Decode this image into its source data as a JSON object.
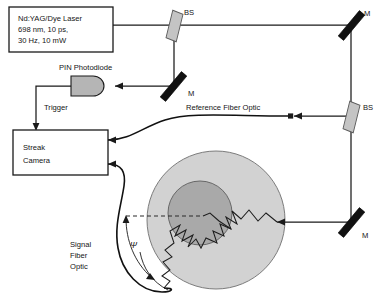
{
  "diagram": {
    "laser_box": {
      "name": "laser-source",
      "lines": [
        "Nd:YAG/Dye Laser",
        "698 nm, 10 ps,",
        "30 Hz, 10 mW"
      ]
    },
    "detector_box": {
      "name": "streak-camera",
      "lines": [
        "Streak",
        "Camera"
      ]
    },
    "components": {
      "photodiode_label": "PIN Photodiode",
      "trigger_label": "Trigger",
      "reference_fiber_label": "Reference Fiber Optic",
      "signal_fiber_lines": [
        "Signal",
        "Fiber",
        "Optic"
      ],
      "angle_symbol": "Ψ"
    },
    "optics": [
      {
        "id": "bs-top",
        "type": "beam-splitter",
        "label": "BS"
      },
      {
        "id": "mirror-top-right",
        "type": "mirror",
        "label": "M"
      },
      {
        "id": "mirror-mid-left",
        "type": "mirror",
        "label": "M"
      },
      {
        "id": "bs-right",
        "type": "beam-splitter",
        "label": "BS"
      },
      {
        "id": "mirror-bottom-right",
        "type": "mirror",
        "label": "M"
      }
    ],
    "phantom": {
      "outer_label": "scattering-medium",
      "inner_label": "absorbing-inclusion"
    },
    "colors": {
      "stroke": "#1a1a1a",
      "mirror_fill": "#111111",
      "beamsplitter_fill": "#c4c4c4",
      "photodiode_fill": "#b5b5b5",
      "phantom_outer": "#d2d2d2",
      "phantom_inner": "#a9a9a9",
      "background": "#ffffff"
    }
  }
}
